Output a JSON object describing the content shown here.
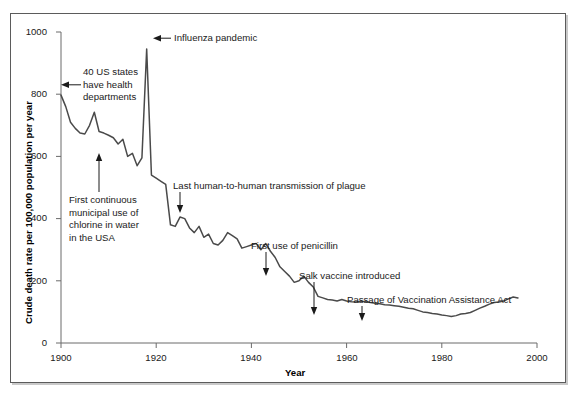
{
  "chart_data": {
    "type": "line",
    "title": "",
    "xlabel": "Year",
    "ylabel": "Crude death rate per 100,000 population per year",
    "xlim": [
      1900,
      2000
    ],
    "ylim": [
      0,
      1000
    ],
    "xticks": [
      1900,
      1920,
      1940,
      1960,
      1980,
      2000
    ],
    "yticks": [
      0,
      200,
      400,
      600,
      800,
      1000
    ],
    "grid": false,
    "legend": "none",
    "series": [
      {
        "name": "Crude death rate",
        "x": [
          1900,
          1901,
          1902,
          1903,
          1904,
          1905,
          1906,
          1907,
          1908,
          1909,
          1910,
          1911,
          1912,
          1913,
          1914,
          1915,
          1916,
          1917,
          1918,
          1919,
          1920,
          1921,
          1922,
          1923,
          1924,
          1925,
          1926,
          1927,
          1928,
          1929,
          1930,
          1931,
          1932,
          1933,
          1934,
          1935,
          1936,
          1937,
          1938,
          1939,
          1940,
          1941,
          1942,
          1943,
          1944,
          1945,
          1946,
          1947,
          1948,
          1949,
          1950,
          1951,
          1952,
          1953,
          1954,
          1955,
          1956,
          1957,
          1958,
          1959,
          1960,
          1961,
          1962,
          1963,
          1964,
          1965,
          1966,
          1967,
          1968,
          1969,
          1970,
          1971,
          1972,
          1973,
          1974,
          1975,
          1976,
          1977,
          1978,
          1979,
          1980,
          1981,
          1982,
          1983,
          1984,
          1985,
          1986,
          1987,
          1988,
          1989,
          1990,
          1991,
          1992,
          1993,
          1994,
          1995,
          1996
        ],
        "values": [
          797,
          760,
          710,
          690,
          675,
          672,
          700,
          742,
          680,
          675,
          668,
          660,
          640,
          655,
          600,
          610,
          570,
          595,
          945,
          540,
          530,
          520,
          510,
          380,
          375,
          405,
          400,
          370,
          355,
          375,
          340,
          350,
          320,
          315,
          330,
          355,
          345,
          335,
          305,
          310,
          315,
          320,
          300,
          320,
          295,
          275,
          245,
          230,
          215,
          195,
          200,
          215,
          195,
          180,
          150,
          145,
          140,
          138,
          135,
          140,
          135,
          133,
          132,
          134,
          133,
          130,
          128,
          126,
          123,
          122,
          120,
          118,
          115,
          112,
          110,
          105,
          100,
          98,
          95,
          93,
          90,
          88,
          85,
          88,
          93,
          95,
          98,
          105,
          112,
          118,
          125,
          130,
          132,
          135,
          142,
          148,
          145
        ]
      }
    ],
    "annotations": [
      {
        "id": "states-health-depts",
        "text_lines": [
          "40 US states",
          "have health",
          "departments"
        ],
        "arrow": "left",
        "year": 1900,
        "value": 797
      },
      {
        "id": "influenza-pandemic",
        "text_lines": [
          "Influenza pandemic"
        ],
        "arrow": "left",
        "year": 1918,
        "value": 945
      },
      {
        "id": "chlorine-water",
        "text_lines": [
          "First continuous",
          "municipal use of",
          "chlorine in water",
          "in the USA"
        ],
        "arrow": "up",
        "year": 1908,
        "value": 570
      },
      {
        "id": "plague-transmission",
        "text_lines": [
          "Last human-to-human transmission of plague"
        ],
        "arrow": "down",
        "year": 1924,
        "value": 375
      },
      {
        "id": "first-penicillin",
        "text_lines": [
          "First use of penicillin"
        ],
        "arrow": "down",
        "year": 1943,
        "value": 205
      },
      {
        "id": "salk-vaccine",
        "text_lines": [
          "Salk vaccine introduced"
        ],
        "arrow": "down",
        "year": 1953,
        "value": 80
      },
      {
        "id": "vaccination-assistance-act",
        "text_lines": [
          "Passage of Vaccination Assistance Act"
        ],
        "arrow": "down",
        "year": 1963,
        "value": 70
      }
    ],
    "colors": {
      "line": "#4a4a4a",
      "axis": "#6b6b6b",
      "text": "#1a1a1a",
      "frame": "#5b5b5b",
      "background": "#ffffff"
    }
  },
  "axis": {
    "x_title": "Year",
    "y_title": "Crude death rate per 100,000 population per year",
    "x_tick_labels": [
      "1900",
      "1920",
      "1940",
      "1960",
      "1980",
      "2000"
    ],
    "y_tick_labels": [
      "0",
      "200",
      "400",
      "600",
      "800",
      "1000"
    ]
  },
  "annotation_text": {
    "states_l1": "40 US states",
    "states_l2": "have health",
    "states_l3": "departments",
    "influenza": "Influenza pandemic",
    "chlorine_l1": "First continuous",
    "chlorine_l2": "municipal use of",
    "chlorine_l3": "chlorine in water",
    "chlorine_l4": "in the USA",
    "plague": "Last human-to-human transmission of plague",
    "penicillin": "First use of penicillin",
    "salk": "Salk vaccine introduced",
    "vaccination_act": "Passage of Vaccination Assistance Act"
  }
}
